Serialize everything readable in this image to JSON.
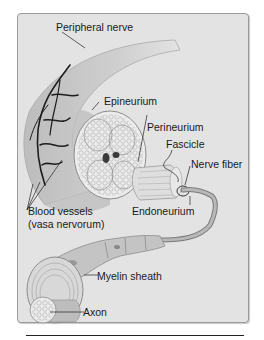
{
  "diagram": {
    "colors": {
      "panel_bg": "#e3e3e3",
      "panel_border": "#9a9a9a",
      "nerve_fill": "#c9c9c9",
      "vessel": "#1e1e1e",
      "text": "#1a1a1a"
    },
    "labels": [
      {
        "id": "peripheral-nerve",
        "text": "Peripheral nerve"
      },
      {
        "id": "epineurium",
        "text": "Epineurium"
      },
      {
        "id": "perineurium",
        "text": "Perineurium"
      },
      {
        "id": "fascicle",
        "text": "Fascicle"
      },
      {
        "id": "nerve-fiber",
        "text": "Nerve fiber"
      },
      {
        "id": "blood-vessels",
        "text": "Blood vessels"
      },
      {
        "id": "vasa-nervorum",
        "text": "(vasa nervorum)"
      },
      {
        "id": "endoneurium",
        "text": "Endoneurium"
      },
      {
        "id": "myelin-sheath",
        "text": "Myelin sheath"
      },
      {
        "id": "axon",
        "text": "Axon"
      }
    ]
  }
}
